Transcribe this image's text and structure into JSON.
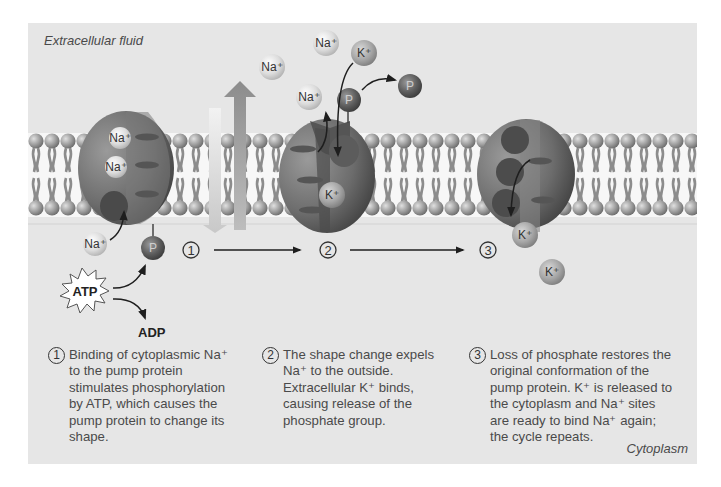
{
  "colors": {
    "background": "#e6e6e6",
    "membrane_interior": "#f7f7f7",
    "lipid_head": "#9a9a9a",
    "lipid_tail": "#8e8e8e",
    "protein": "#6e6e6e",
    "ion_light": "#d2d2d2",
    "ion_mid": "#a8a8a8",
    "phosphate": "#5a5a5a",
    "text": "#4a4a4a"
  },
  "regions": {
    "extracellular": "Extracellular fluid",
    "cytoplasm": "Cytoplasm"
  },
  "ions": {
    "sodium": "Na+",
    "potassium": "K+",
    "phosphate": "P"
  },
  "molecules": {
    "atp": "ATP",
    "adp": "ADP"
  },
  "steps": [
    {
      "number": "1",
      "caption": "Binding of cytoplasmic Na+ to the pump protein stimulates phosphorylation by ATP, which causes the pump protein to change its shape.",
      "lines": [
        "Binding of cytoplasmic Na⁺",
        "to the pump protein",
        "stimulates phosphorylation",
        "by ATP, which causes the",
        "pump protein to change its",
        "shape."
      ]
    },
    {
      "number": "2",
      "caption": "The shape change expels Na+ to the outside. Extracellular K+ binds, causing release of the phosphate group.",
      "lines": [
        "The shape change expels",
        "Na⁺ to the outside.",
        "Extracellular K⁺ binds,",
        "causing release of the",
        "phosphate group."
      ]
    },
    {
      "number": "3",
      "caption": "Loss of phosphate restores the original conformation of the pump protein. K+ is released to the cytoplasm and Na+ sites are ready to bind Na+ again; the cycle repeats.",
      "lines": [
        "Loss of phosphate restores the",
        "original conformation of the",
        "pump protein. K⁺ is released to",
        "the cytoplasm and Na⁺ sites",
        "are ready to bind Na⁺ again;",
        "the cycle repeats."
      ]
    }
  ],
  "labels": {
    "na": "Na⁺",
    "k": "K⁺",
    "p": "P"
  }
}
